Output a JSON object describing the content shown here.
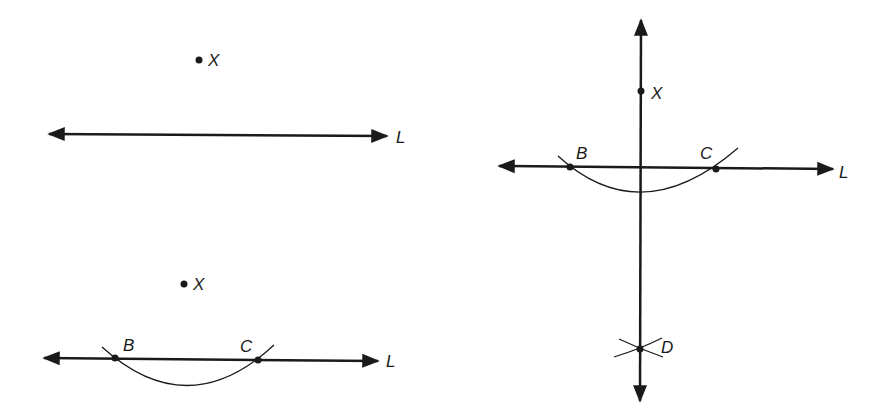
{
  "diagram": {
    "panels": [
      {
        "id": "step1",
        "point": {
          "label": "X",
          "x": 199,
          "y": 60
        },
        "line": {
          "label": "L",
          "x1": 47,
          "x2": 387,
          "y": 135
        }
      },
      {
        "id": "step2",
        "point": {
          "label": "X",
          "x": 184,
          "y": 284
        },
        "line": {
          "label": "L",
          "x1": 42,
          "x2": 378,
          "y": 358
        },
        "intersections": [
          {
            "label": "B",
            "x": 115,
            "y": 358
          },
          {
            "label": "C",
            "x": 258,
            "y": 360
          }
        ]
      },
      {
        "id": "step3",
        "point": {
          "label": "X",
          "x": 641,
          "y": 91
        },
        "line": {
          "label": "L",
          "x1": 497,
          "x2": 833,
          "y": 167
        },
        "intersections": [
          {
            "label": "B",
            "x": 570,
            "y": 167
          },
          {
            "label": "C",
            "x": 716,
            "y": 169
          }
        ],
        "arc_intersection": {
          "label": "D",
          "x": 640,
          "y": 349
        },
        "perpendicular": {
          "x": 641,
          "y1": 18,
          "y2": 403
        }
      }
    ],
    "labels": {
      "p1_x": "X",
      "p1_l": "L",
      "p2_x": "X",
      "p2_l": "L",
      "p2_b": "B",
      "p2_c": "C",
      "p3_x": "X",
      "p3_l": "L",
      "p3_b": "B",
      "p3_c": "C",
      "p3_d": "D"
    },
    "colors": {
      "ink": "#1a1a1a",
      "background": "#ffffff"
    }
  }
}
